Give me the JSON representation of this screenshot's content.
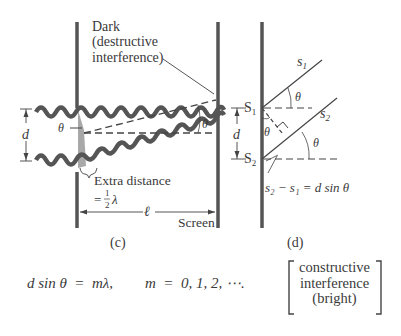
{
  "panel_c": {
    "caption": "(c)",
    "dark_label_line1": "Dark",
    "dark_label_line2": "(destructive",
    "dark_label_line3": "interference)",
    "extra_distance_line1": "Extra distance",
    "extra_distance_eq": "=",
    "extra_distance_num": "1",
    "extra_distance_den": "2",
    "extra_distance_lambda": "λ",
    "d_label": "d",
    "theta_left": "θ",
    "theta_right": "θ",
    "ell_label": "ℓ",
    "screen_label": "Screen"
  },
  "panel_d": {
    "caption": "(d)",
    "s1_ray": "s",
    "s1_ray_sub": "1",
    "s2_ray": "s",
    "s2_ray_sub": "2",
    "slit1": "S",
    "slit1_sub": "1",
    "slit2": "S",
    "slit2_sub": "2",
    "d_label": "d",
    "theta_top": "θ",
    "theta_mid": "θ",
    "theta_bottom": "θ",
    "path_diff_eq": "s₂ − s₁ = d sin θ"
  },
  "equation": {
    "lhs": "d sin θ  =  mλ,",
    "m_values": "m  =  0, 1, 2, ⋯.",
    "bracket_line1": "constructive",
    "bracket_line2": "interference",
    "bracket_line3": "(bright)"
  },
  "colors": {
    "ink": "#3a3a3a",
    "wall": "#555555",
    "shade": "#999999"
  }
}
